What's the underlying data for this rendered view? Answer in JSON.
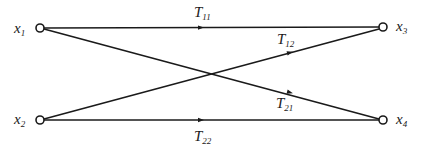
{
  "diagram": {
    "type": "signal-flow-graph",
    "colors": {
      "stroke": "#1a1a1a",
      "background": "#ffffff"
    },
    "nodes": [
      {
        "id": "x1",
        "label": "x",
        "sub": "1",
        "x": 40,
        "y": 28
      },
      {
        "id": "x2",
        "label": "x",
        "sub": "2",
        "x": 40,
        "y": 120
      },
      {
        "id": "x3",
        "label": "x",
        "sub": "3",
        "x": 383,
        "y": 27
      },
      {
        "id": "x4",
        "label": "x",
        "sub": "4",
        "x": 383,
        "y": 120
      }
    ],
    "edges": [
      {
        "id": "T11",
        "from": "x1",
        "to": "x3",
        "label": "T",
        "sub": "11"
      },
      {
        "id": "T12",
        "from": "x2",
        "to": "x3",
        "label": "T",
        "sub": "12"
      },
      {
        "id": "T21",
        "from": "x1",
        "to": "x4",
        "label": "T",
        "sub": "21"
      },
      {
        "id": "T22",
        "from": "x2",
        "to": "x4",
        "label": "T",
        "sub": "22"
      }
    ]
  }
}
